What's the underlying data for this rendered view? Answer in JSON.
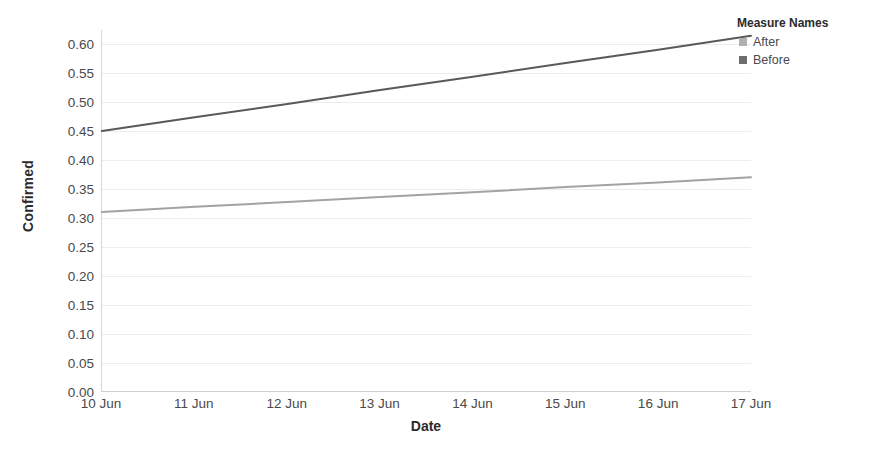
{
  "chart_data": {
    "type": "line",
    "title": "",
    "xlabel": "Date",
    "ylabel": "Confirmed",
    "x": [
      "10 Jun",
      "11 Jun",
      "12 Jun",
      "13 Jun",
      "14 Jun",
      "15 Jun",
      "16 Jun",
      "17 Jun"
    ],
    "xtick_labels": [
      "10 Jun",
      "11 Jun",
      "12 Jun",
      "13 Jun",
      "14 Jun",
      "15 Jun",
      "16 Jun",
      "17 Jun"
    ],
    "ytick_labels": [
      "0.60",
      "0.55",
      "0.50",
      "0.45",
      "0.40",
      "0.35",
      "0.30",
      "0.25",
      "0.20",
      "0.15",
      "0.10",
      "0.05",
      "0.00"
    ],
    "ytick_values": [
      0.6,
      0.55,
      0.5,
      0.45,
      0.4,
      0.35,
      0.3,
      0.25,
      0.2,
      0.15,
      0.1,
      0.05,
      0.0
    ],
    "ylim": [
      0.0,
      0.625
    ],
    "grid": "horizontal",
    "legend_position": "right",
    "series": [
      {
        "name": "Before",
        "color": "#595959",
        "values": [
          0.45,
          0.474,
          0.497,
          0.521,
          0.544,
          0.568,
          0.591,
          0.615
        ]
      },
      {
        "name": "After",
        "color": "#a3a3a3",
        "values": [
          0.31,
          0.319,
          0.327,
          0.336,
          0.344,
          0.353,
          0.361,
          0.37
        ]
      }
    ]
  },
  "legend": {
    "title": "Measure Names",
    "items": [
      {
        "label": "After",
        "color": "#b0b0b0"
      },
      {
        "label": "Before",
        "color": "#6e6e6e"
      }
    ]
  },
  "axes": {
    "y_title": "Confirmed",
    "x_title": "Date"
  }
}
